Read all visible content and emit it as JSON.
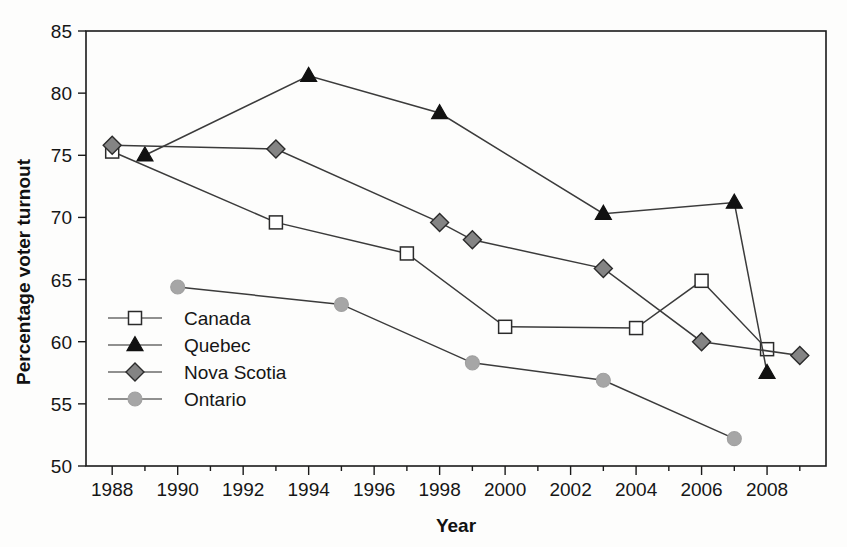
{
  "chart_data": {
    "type": "line",
    "title": "",
    "xlabel": "Year",
    "ylabel": "Percentage voter turnout",
    "xlim": [
      1987.2,
      2009.8
    ],
    "ylim": [
      50,
      85
    ],
    "ytick_step": 5,
    "xtick_step": 2,
    "yticks": [
      "50",
      "55",
      "60",
      "65",
      "70",
      "75",
      "80",
      "85"
    ],
    "xticks": [
      "1988",
      "1990",
      "1992",
      "1994",
      "1996",
      "1998",
      "2000",
      "2002",
      "2004",
      "2006",
      "2008"
    ],
    "grid": false,
    "legend_position": "inside-lower-left",
    "series": [
      {
        "name": "Canada",
        "marker": "open-square",
        "marker_fill": "#ffffff",
        "marker_stroke": "#2b2b2b",
        "line_color": "#3b3b3b",
        "x": [
          1988,
          1993,
          1997,
          2000,
          2004,
          2006,
          2008
        ],
        "values": [
          75.3,
          69.6,
          67.1,
          61.2,
          61.1,
          64.9,
          59.4
        ]
      },
      {
        "name": "Quebec",
        "marker": "filled-triangle",
        "marker_fill": "#111111",
        "marker_stroke": "#111111",
        "line_color": "#3b3b3b",
        "x": [
          1989,
          1994,
          1998,
          2003,
          2007,
          2008
        ],
        "values": [
          75.0,
          81.4,
          78.4,
          70.3,
          71.2,
          57.5
        ]
      },
      {
        "name": "Nova Scotia",
        "marker": "filled-diamond",
        "marker_fill": "#848484",
        "marker_stroke": "#2b2b2b",
        "line_color": "#3b3b3b",
        "x": [
          1988,
          1993,
          1998,
          1999,
          2003,
          2006,
          2009
        ],
        "values": [
          75.8,
          75.5,
          69.6,
          68.2,
          65.9,
          60.0,
          58.9
        ]
      },
      {
        "name": "Ontario",
        "marker": "filled-circle",
        "marker_fill": "#a6a6a6",
        "marker_stroke": "#a0a0a0",
        "line_color": "#6b6b6b",
        "x": [
          1990,
          1995,
          1999,
          2003,
          2007
        ],
        "values": [
          64.4,
          63.0,
          58.3,
          56.9,
          52.2
        ]
      }
    ]
  },
  "legend": {
    "items": [
      {
        "label": "Canada"
      },
      {
        "label": "Quebec"
      },
      {
        "label": "Nova Scotia"
      },
      {
        "label": "Ontario"
      }
    ]
  }
}
